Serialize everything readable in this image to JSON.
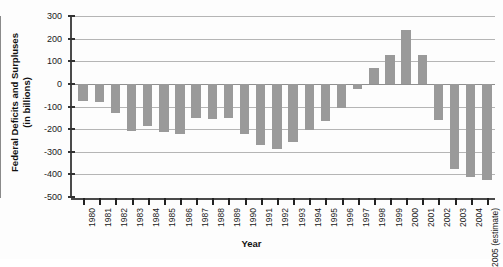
{
  "chart_data": {
    "type": "bar",
    "title": "",
    "xlabel": "Year",
    "ylabel": "Federal Deficits and Surpluses (in billions)",
    "ylabel_line1": "Federal Deficits and Surpluses",
    "ylabel_line2": "(in billions)",
    "ylim": [
      -500,
      300
    ],
    "yticks": [
      300,
      200,
      100,
      0,
      -100,
      -200,
      -300,
      -400,
      -500
    ],
    "ytick_labels": [
      "300",
      "200",
      "100",
      "0",
      "-100",
      "-200",
      "-300",
      "-400",
      "-500"
    ],
    "grid": true,
    "legend": "none",
    "bar_color": "#9a9a9a",
    "categories": [
      "1980",
      "1981",
      "1982",
      "1983",
      "1984",
      "1985",
      "1986",
      "1987",
      "1988",
      "1989",
      "1990",
      "1991",
      "1992",
      "1993",
      "1994",
      "1995",
      "1996",
      "1997",
      "1998",
      "1999",
      "2000",
      "2001",
      "2002",
      "2003",
      "2004",
      "2005"
    ],
    "category_sublabels": [
      "",
      "",
      "",
      "",
      "",
      "",
      "",
      "",
      "",
      "",
      "",
      "",
      "",
      "",
      "",
      "",
      "",
      "",
      "",
      "",
      "",
      "",
      "",
      "",
      "",
      "(estimate)"
    ],
    "values": [
      -74,
      -79,
      -128,
      -208,
      -185,
      -212,
      -221,
      -150,
      -155,
      -153,
      -221,
      -269,
      -290,
      -255,
      -203,
      -164,
      -107,
      -22,
      69,
      126,
      236,
      128,
      -158,
      -375,
      -412,
      -427
    ]
  }
}
